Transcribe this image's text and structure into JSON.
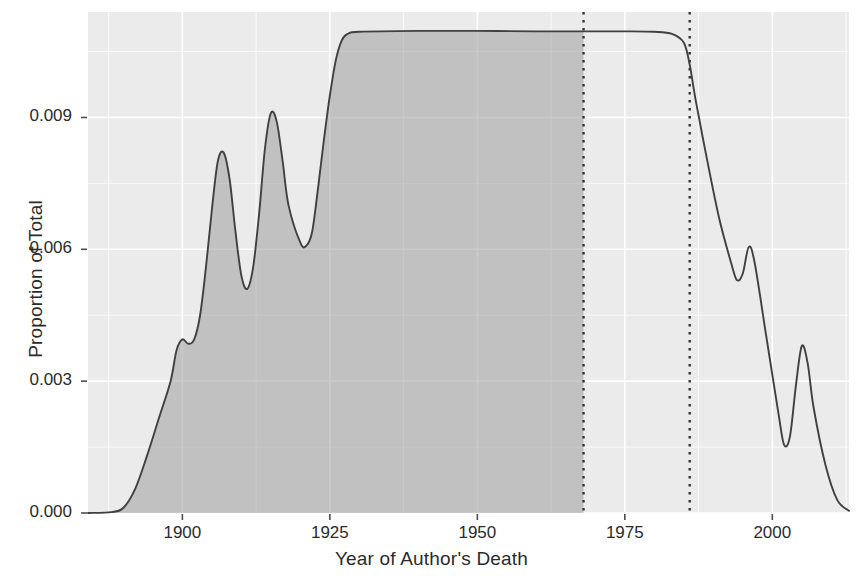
{
  "chart_data": {
    "type": "area",
    "title": "",
    "xlabel": "Year of Author's Death",
    "ylabel": "Proportion of Total",
    "xlim": [
      1884,
      2013
    ],
    "ylim": [
      0.0,
      0.0114
    ],
    "xticks": [
      1900,
      1925,
      1950,
      1975,
      2000
    ],
    "xtick_labels": [
      "1900",
      "1925",
      "1950",
      "1975",
      "2000"
    ],
    "yticks": [
      0.0,
      0.003,
      0.006,
      0.009
    ],
    "ytick_labels": [
      "0.000",
      "0.003",
      "0.006",
      "0.009"
    ],
    "grid": true,
    "legend": "none",
    "panel_bg": "#EBEBEB",
    "grid_color": "#FFFFFF",
    "line_color": "#404040",
    "fill_color": "#9E9E9E",
    "fill_opacity": 0.55,
    "annotations": [
      {
        "type": "vline",
        "x": 1968,
        "style": "dotted",
        "color": "#333333",
        "label": "shaded-region-end"
      },
      {
        "type": "vline",
        "x": 1986,
        "style": "dotted",
        "color": "#333333",
        "label": "second-marker"
      }
    ],
    "shaded_region": {
      "x_start": 1884,
      "x_end": 1968
    },
    "series": [
      {
        "name": "Proportion of Total",
        "points": [
          {
            "x": 1884,
            "y": 0.0
          },
          {
            "x": 1888,
            "y": 2e-05
          },
          {
            "x": 1890,
            "y": 0.00012
          },
          {
            "x": 1892,
            "y": 0.00055
          },
          {
            "x": 1894,
            "y": 0.0013
          },
          {
            "x": 1896,
            "y": 0.00215
          },
          {
            "x": 1898,
            "y": 0.003
          },
          {
            "x": 1899,
            "y": 0.0037
          },
          {
            "x": 1900,
            "y": 0.00395
          },
          {
            "x": 1901,
            "y": 0.00385
          },
          {
            "x": 1902,
            "y": 0.00395
          },
          {
            "x": 1903,
            "y": 0.0045
          },
          {
            "x": 1904,
            "y": 0.0056
          },
          {
            "x": 1905,
            "y": 0.0069
          },
          {
            "x": 1906,
            "y": 0.008
          },
          {
            "x": 1907,
            "y": 0.0082
          },
          {
            "x": 1908,
            "y": 0.0076
          },
          {
            "x": 1909,
            "y": 0.0064
          },
          {
            "x": 1910,
            "y": 0.0054
          },
          {
            "x": 1911,
            "y": 0.0051
          },
          {
            "x": 1912,
            "y": 0.0056
          },
          {
            "x": 1913,
            "y": 0.0068
          },
          {
            "x": 1914,
            "y": 0.0083
          },
          {
            "x": 1915,
            "y": 0.0091
          },
          {
            "x": 1916,
            "y": 0.0089
          },
          {
            "x": 1917,
            "y": 0.008
          },
          {
            "x": 1918,
            "y": 0.007
          },
          {
            "x": 1920,
            "y": 0.00615
          },
          {
            "x": 1921,
            "y": 0.00608
          },
          {
            "x": 1922,
            "y": 0.0064
          },
          {
            "x": 1923,
            "y": 0.0074
          },
          {
            "x": 1924,
            "y": 0.0085
          },
          {
            "x": 1925,
            "y": 0.0095
          },
          {
            "x": 1926,
            "y": 0.0103
          },
          {
            "x": 1927,
            "y": 0.01075
          },
          {
            "x": 1928,
            "y": 0.0109
          },
          {
            "x": 1930,
            "y": 0.01095
          },
          {
            "x": 1940,
            "y": 0.01097
          },
          {
            "x": 1950,
            "y": 0.01097
          },
          {
            "x": 1960,
            "y": 0.01096
          },
          {
            "x": 1968,
            "y": 0.01096
          },
          {
            "x": 1975,
            "y": 0.01096
          },
          {
            "x": 1980,
            "y": 0.01095
          },
          {
            "x": 1983,
            "y": 0.0109
          },
          {
            "x": 1985,
            "y": 0.0107
          },
          {
            "x": 1986,
            "y": 0.0102
          },
          {
            "x": 1987,
            "y": 0.0094
          },
          {
            "x": 1989,
            "y": 0.008
          },
          {
            "x": 1991,
            "y": 0.0067
          },
          {
            "x": 1993,
            "y": 0.0057
          },
          {
            "x": 1994,
            "y": 0.0053
          },
          {
            "x": 1995,
            "y": 0.00545
          },
          {
            "x": 1996,
            "y": 0.00605
          },
          {
            "x": 1997,
            "y": 0.0057
          },
          {
            "x": 1999,
            "y": 0.004
          },
          {
            "x": 2001,
            "y": 0.0023
          },
          {
            "x": 2002,
            "y": 0.00155
          },
          {
            "x": 2003,
            "y": 0.00175
          },
          {
            "x": 2004,
            "y": 0.0029
          },
          {
            "x": 2005,
            "y": 0.0038
          },
          {
            "x": 2006,
            "y": 0.0034
          },
          {
            "x": 2007,
            "y": 0.0024
          },
          {
            "x": 2009,
            "y": 0.0011
          },
          {
            "x": 2011,
            "y": 0.0003
          },
          {
            "x": 2013,
            "y": 5e-05
          }
        ]
      }
    ]
  }
}
